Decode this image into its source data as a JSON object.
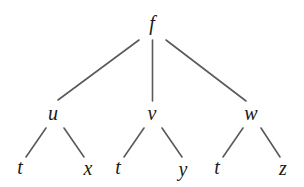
{
  "diagram": {
    "type": "tree",
    "root": {
      "id": "f",
      "label": "f",
      "x": 152,
      "y": 23,
      "children": [
        "u",
        "v",
        "w"
      ]
    },
    "nodes": [
      {
        "id": "f",
        "label": "f",
        "x": 152,
        "y": 23
      },
      {
        "id": "u",
        "label": "u",
        "x": 53,
        "y": 113
      },
      {
        "id": "v",
        "label": "v",
        "x": 152,
        "y": 113
      },
      {
        "id": "w",
        "label": "w",
        "x": 251,
        "y": 113
      },
      {
        "id": "u_t",
        "label": "t",
        "x": 20,
        "y": 167
      },
      {
        "id": "u_x",
        "label": "x",
        "x": 88,
        "y": 168
      },
      {
        "id": "v_t",
        "label": "t",
        "x": 118,
        "y": 167
      },
      {
        "id": "v_y",
        "label": "y",
        "x": 183,
        "y": 169
      },
      {
        "id": "w_t",
        "label": "t",
        "x": 217,
        "y": 167
      },
      {
        "id": "w_z",
        "label": "z",
        "x": 283,
        "y": 168
      }
    ],
    "edges": [
      {
        "from": "f",
        "to": "u",
        "x1": 139,
        "y1": 40,
        "x2": 58,
        "y2": 100
      },
      {
        "from": "f",
        "to": "v",
        "x1": 152.5,
        "y1": 40,
        "x2": 152.5,
        "y2": 101
      },
      {
        "from": "f",
        "to": "w",
        "x1": 166,
        "y1": 40,
        "x2": 246,
        "y2": 101
      },
      {
        "from": "u",
        "to": "u_t",
        "x1": 46,
        "y1": 128,
        "x2": 26,
        "y2": 157
      },
      {
        "from": "u",
        "to": "u_x",
        "x1": 64,
        "y1": 128,
        "x2": 84,
        "y2": 157
      },
      {
        "from": "v",
        "to": "v_t",
        "x1": 144,
        "y1": 128,
        "x2": 124,
        "y2": 157
      },
      {
        "from": "v",
        "to": "v_y",
        "x1": 162,
        "y1": 128,
        "x2": 182,
        "y2": 157
      },
      {
        "from": "w",
        "to": "w_t",
        "x1": 243,
        "y1": 128,
        "x2": 223,
        "y2": 157
      },
      {
        "from": "w",
        "to": "w_z",
        "x1": 261,
        "y1": 128,
        "x2": 280,
        "y2": 157
      }
    ],
    "colors": {
      "edge": "#5a5a5a",
      "text": "#1a1a1a",
      "background": "#ffffff"
    }
  }
}
